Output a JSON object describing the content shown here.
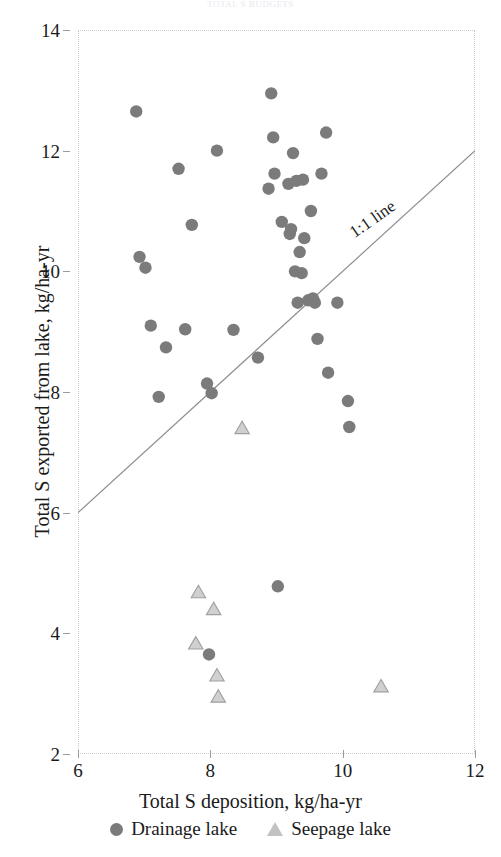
{
  "figure": {
    "clipped_title": "TOTAL S BUDGETS",
    "axis_color": "#9a9aa2",
    "frame_color": "#c9c9cf",
    "drainage_color": "#7b7b7b",
    "seepage_fill": "#d0d0d0",
    "seepage_stroke": "#9f9f9f",
    "line_color": "#8d8d93"
  },
  "x_axis": {
    "title": "Total S deposition, kg/ha-yr",
    "ticks": [
      6,
      8,
      10,
      12
    ],
    "min": 6,
    "max": 12
  },
  "y_axis": {
    "title": "Total S exported from lake, kg/ha-yr",
    "ticks": [
      2,
      4,
      6,
      8,
      10,
      12,
      14
    ],
    "min": 2,
    "max": 14
  },
  "annotations": [
    {
      "name": "one-to-one-line-label",
      "text": "1:1 line",
      "x": 10.05,
      "y": 10.75,
      "rotation": -35
    }
  ],
  "legend": {
    "items": [
      {
        "label": "Drainage lake",
        "marker": "circle"
      },
      {
        "label": "Seepage lake",
        "marker": "triangle"
      }
    ]
  },
  "chart_data": {
    "type": "scatter",
    "title": "TOTAL S BUDGETS",
    "xlabel": "Total S deposition, kg/ha-yr",
    "ylabel": "Total S exported from lake, kg/ha-yr",
    "xlim": [
      6,
      12
    ],
    "ylim": [
      2,
      14
    ],
    "xticks": [
      6,
      8,
      10,
      12
    ],
    "yticks": [
      2,
      4,
      6,
      8,
      10,
      12,
      14
    ],
    "grid": false,
    "legend_position": "below-axis",
    "reference_line": {
      "name": "1:1 line",
      "label": "1:1 line",
      "from": [
        6.0,
        6.0
      ],
      "to": [
        12.0,
        12.0
      ],
      "slope": 1,
      "intercept": 0
    },
    "series": [
      {
        "name": "Drainage lake",
        "marker": "circle",
        "color": "#7b7b7b",
        "points": [
          [
            6.88,
            12.65
          ],
          [
            6.93,
            10.24
          ],
          [
            7.02,
            10.06
          ],
          [
            7.1,
            9.1
          ],
          [
            7.22,
            7.92
          ],
          [
            7.33,
            8.74
          ],
          [
            7.52,
            11.7
          ],
          [
            7.62,
            9.04
          ],
          [
            7.72,
            10.77
          ],
          [
            7.95,
            8.14
          ],
          [
            8.02,
            7.98
          ],
          [
            8.1,
            12.0
          ],
          [
            8.35,
            9.03
          ],
          [
            8.72,
            8.57
          ],
          [
            8.88,
            11.37
          ],
          [
            8.92,
            12.95
          ],
          [
            8.95,
            12.22
          ],
          [
            8.97,
            11.62
          ],
          [
            9.02,
            4.78
          ],
          [
            9.08,
            10.82
          ],
          [
            9.18,
            11.45
          ],
          [
            9.2,
            10.62
          ],
          [
            9.22,
            10.7
          ],
          [
            9.25,
            11.96
          ],
          [
            9.28,
            10.0
          ],
          [
            9.3,
            11.5
          ],
          [
            9.32,
            9.48
          ],
          [
            9.35,
            10.32
          ],
          [
            9.38,
            9.97
          ],
          [
            9.4,
            11.52
          ],
          [
            9.42,
            10.55
          ],
          [
            9.48,
            9.52
          ],
          [
            9.52,
            11.0
          ],
          [
            9.55,
            9.55
          ],
          [
            9.58,
            9.48
          ],
          [
            9.62,
            8.88
          ],
          [
            9.68,
            11.62
          ],
          [
            9.75,
            12.3
          ],
          [
            9.78,
            8.32
          ],
          [
            9.92,
            9.48
          ],
          [
            10.08,
            7.85
          ],
          [
            10.1,
            7.42
          ],
          [
            7.98,
            3.65
          ]
        ]
      },
      {
        "name": "Seepage lake",
        "marker": "triangle",
        "color": "#d0d0d0",
        "points": [
          [
            8.48,
            7.4
          ],
          [
            7.82,
            4.68
          ],
          [
            8.05,
            4.4
          ],
          [
            7.78,
            3.83
          ],
          [
            8.1,
            3.3
          ],
          [
            8.12,
            2.95
          ],
          [
            10.58,
            3.12
          ]
        ]
      }
    ]
  }
}
